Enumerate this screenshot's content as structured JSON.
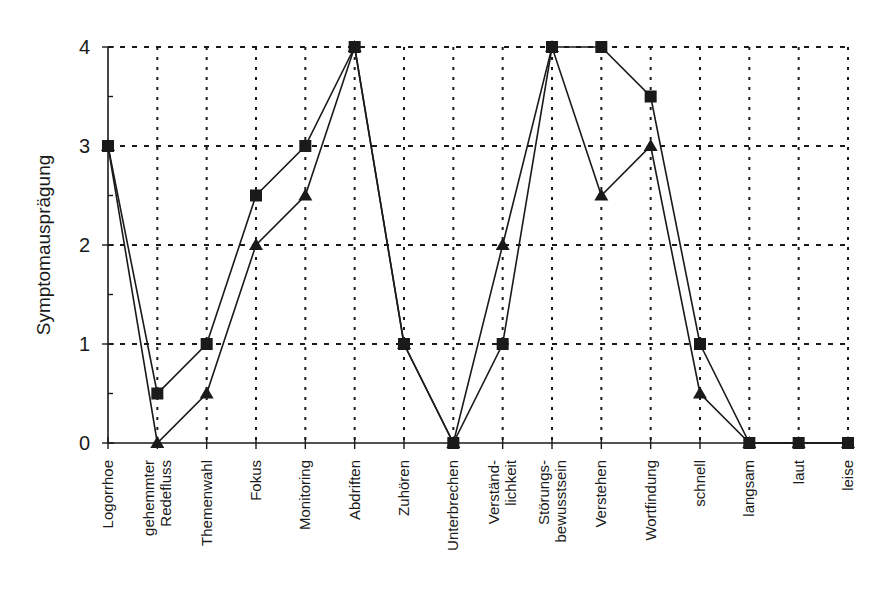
{
  "chart_data": {
    "type": "line",
    "title": "",
    "xlabel": "",
    "ylabel": "Symptomausprägung",
    "ylim": [
      0,
      4
    ],
    "yticks": [
      0,
      1,
      2,
      3,
      4
    ],
    "grid": true,
    "legend": null,
    "categories": [
      [
        "Logorrhoe"
      ],
      [
        "gehemmter",
        "Redefluss"
      ],
      [
        "Themenwahl"
      ],
      [
        "Fokus"
      ],
      [
        "Monitoring"
      ],
      [
        "Abdriften"
      ],
      [
        "Zuhören"
      ],
      [
        "Unterbrechen"
      ],
      [
        "Verständ-",
        "lichkeit"
      ],
      [
        "Störungs-",
        "bewusstsein"
      ],
      [
        "Verstehen"
      ],
      [
        "Wortfindung"
      ],
      [
        "schnell"
      ],
      [
        "langsam"
      ],
      [
        "laut"
      ],
      [
        "leise"
      ]
    ],
    "series": [
      {
        "name": "Series A (square markers)",
        "marker": "square",
        "values": [
          3,
          0.5,
          1,
          2.5,
          3,
          4,
          1,
          0,
          1,
          4,
          4,
          3.5,
          1,
          0,
          0,
          0
        ]
      },
      {
        "name": "Series B (triangle markers)",
        "marker": "triangle",
        "values": [
          3,
          0,
          0.5,
          2,
          2.5,
          4,
          1,
          0,
          2,
          4,
          2.5,
          3,
          0.5,
          0,
          0,
          0
        ]
      }
    ],
    "colors": {
      "line": "#1a1a1a",
      "marker": "#1a1a1a",
      "grid": "#1a1a1a"
    }
  }
}
